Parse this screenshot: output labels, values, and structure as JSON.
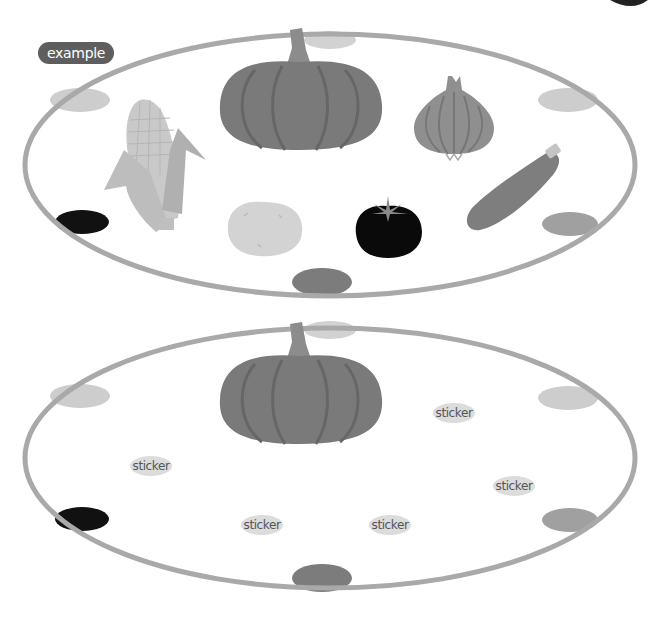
{
  "badge": {
    "label": "example"
  },
  "colors": {
    "ring": "#a8a8a8",
    "dot_light": "#cfcfcf",
    "dot_mid": "#9a9a9a",
    "dot_dark": "#7a7a7a",
    "dot_black": "#111111",
    "pumpkin": "#7b7b7b",
    "sticker_bg": "#dcdcdc"
  },
  "example_plate": {
    "vegetables": [
      {
        "name": "corn"
      },
      {
        "name": "pumpkin"
      },
      {
        "name": "onion"
      },
      {
        "name": "potato"
      },
      {
        "name": "tomato"
      },
      {
        "name": "zucchini"
      }
    ]
  },
  "exercise_plate": {
    "vegetables": [
      {
        "name": "pumpkin"
      }
    ],
    "stickers": [
      {
        "label": "sticker"
      },
      {
        "label": "sticker"
      },
      {
        "label": "sticker"
      },
      {
        "label": "sticker"
      },
      {
        "label": "sticker"
      }
    ]
  }
}
